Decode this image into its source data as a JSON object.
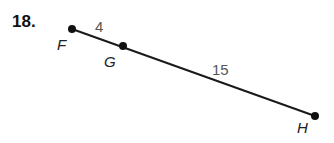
{
  "problem": {
    "number": "18."
  },
  "figure": {
    "points": [
      {
        "name": "F",
        "x": 72,
        "y": 29
      },
      {
        "name": "G",
        "x": 123,
        "y": 46
      },
      {
        "name": "H",
        "x": 315,
        "y": 116
      }
    ],
    "segments": [
      {
        "from": "F",
        "to": "G",
        "length_label": "4"
      },
      {
        "from": "G",
        "to": "H",
        "length_label": "15"
      }
    ],
    "labels": {
      "F": "F",
      "G": "G",
      "H": "H",
      "FG": "4",
      "GH": "15"
    }
  }
}
